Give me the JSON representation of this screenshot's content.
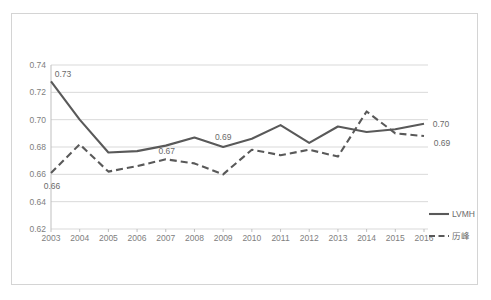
{
  "chart_data": {
    "type": "line",
    "title": "",
    "subtitle": "",
    "xlabel": "",
    "ylabel": "",
    "categories": [
      "2003",
      "2004",
      "2005",
      "2006",
      "2007",
      "2008",
      "2009",
      "2010",
      "2011",
      "2012",
      "2013",
      "2014",
      "2015",
      "2016"
    ],
    "ylim": [
      0.62,
      0.74
    ],
    "yticks": [
      "0.62",
      "0.64",
      "0.66",
      "0.68",
      "0.70",
      "0.72",
      "0.74"
    ],
    "ytick_values": [
      0.62,
      0.64,
      0.66,
      0.68,
      0.7,
      0.72,
      0.74
    ],
    "grid": true,
    "grid_axis": "y",
    "legend_position": "right",
    "series": [
      {
        "name": "LVMH",
        "style": "solid",
        "color": "#595959",
        "values": [
          0.728,
          0.7,
          0.676,
          0.677,
          0.681,
          0.687,
          0.68,
          0.686,
          0.696,
          0.683,
          0.695,
          0.691,
          0.693,
          0.697
        ]
      },
      {
        "name": "历峰",
        "style": "dashed",
        "color": "#595959",
        "values": [
          0.661,
          0.682,
          0.662,
          0.666,
          0.671,
          0.668,
          0.66,
          0.678,
          0.674,
          0.678,
          0.673,
          0.706,
          0.69,
          0.688
        ]
      }
    ],
    "annotations": [
      {
        "text": "0.73",
        "series": "LVMH",
        "category": "2003",
        "value": 0.728
      },
      {
        "text": "0.69",
        "series": "LVMH",
        "category": "2009",
        "value": 0.68
      },
      {
        "text": "0.70",
        "series": "LVMH",
        "category": "2016",
        "value": 0.697
      },
      {
        "text": "0.66",
        "series": "历峰",
        "category": "2003",
        "value": 0.661
      },
      {
        "text": "0.67",
        "series": "历峰",
        "category": "2007",
        "value": 0.671
      },
      {
        "text": "0.69",
        "series": "历峰",
        "category": "2016",
        "value": 0.688
      }
    ]
  },
  "colors": {
    "line": "#595959",
    "grid": "#d9d9d9",
    "axis": "#bfbfbf",
    "tick_text": "#808080",
    "label_text": "#6b6b6b",
    "frame_border": "#d4d4d4",
    "background": "#ffffff"
  },
  "legend": {
    "items": [
      {
        "label": "LVMH",
        "style": "solid"
      },
      {
        "label": "历峰",
        "style": "dashed"
      }
    ]
  }
}
